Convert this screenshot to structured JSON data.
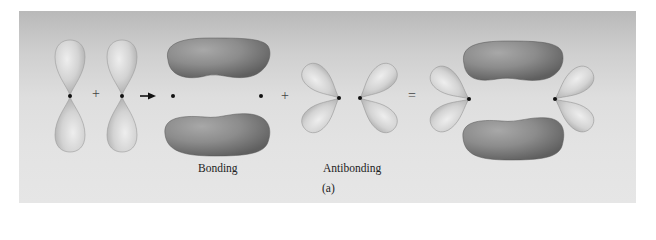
{
  "figure": {
    "panel_label": "(a)",
    "labels": {
      "bonding": "Bonding",
      "antibonding": "Antibonding"
    },
    "operators": {
      "plus_1": "+",
      "arrow": "→",
      "plus_2": "+",
      "equals": "="
    },
    "components": [
      {
        "name": "p-orbital-1",
        "type": "p-orbital",
        "orientation": "vertical"
      },
      {
        "name": "p-orbital-2",
        "type": "p-orbital",
        "orientation": "vertical"
      },
      {
        "name": "bonding-pi-orbital",
        "type": "bonding",
        "label": "Bonding"
      },
      {
        "name": "antibonding-pi-orbital",
        "type": "antibonding",
        "label": "Antibonding"
      },
      {
        "name": "combined-orbital",
        "type": "sum"
      }
    ],
    "colors": {
      "lobe_light": "#d2d2d2",
      "lobe_dark": "#8a8a8a",
      "nucleus": "#111111"
    }
  }
}
